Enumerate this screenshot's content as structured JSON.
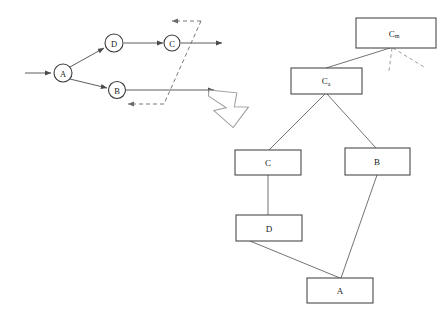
{
  "figure": {
    "left_graph": {
      "name": "execution-graph",
      "nodes": [
        {
          "id": "A",
          "label": "A",
          "cx": 63,
          "cy": 73,
          "r": 9
        },
        {
          "id": "D",
          "label": "D",
          "cx": 114,
          "cy": 43,
          "r": 9
        },
        {
          "id": "C",
          "label": "C",
          "cx": 172,
          "cy": 43,
          "r": 8
        },
        {
          "id": "B",
          "label": "B",
          "cx": 117,
          "cy": 90,
          "r": 8.5
        }
      ],
      "edges": [
        {
          "from": "input",
          "to": "A",
          "style": "solid",
          "arrow": true
        },
        {
          "from": "A",
          "to": "D",
          "style": "solid",
          "arrow": true
        },
        {
          "from": "A",
          "to": "B",
          "style": "solid",
          "arrow": true
        },
        {
          "from": "D",
          "to": "C",
          "style": "solid",
          "arrow": true
        },
        {
          "from": "C",
          "to": "output-top",
          "style": "solid",
          "arrow": true
        },
        {
          "from": "B",
          "to": "output-bottom",
          "style": "solid",
          "arrow": true
        },
        {
          "from": "feedback-right",
          "to": "feedback-top",
          "style": "dashed",
          "arrow": true
        },
        {
          "from": "feedback-right",
          "to": "feedback-bottom",
          "style": "dashed",
          "arrow": true
        }
      ]
    },
    "transform_arrow": {
      "name": "transform-arrow",
      "direction": "down-right"
    },
    "right_tree": {
      "name": "dependency-tree",
      "boxes": [
        {
          "id": "Cm",
          "label": "C",
          "sub": "m",
          "x": 356,
          "y": 18,
          "w": 80,
          "h": 30
        },
        {
          "id": "Ca",
          "label": "C",
          "sub": "a",
          "x": 291,
          "y": 68,
          "w": 71,
          "h": 26
        },
        {
          "id": "C",
          "label": "C",
          "sub": "",
          "x": 235,
          "y": 150,
          "w": 66,
          "h": 25
        },
        {
          "id": "B",
          "label": "B",
          "sub": "",
          "x": 345,
          "y": 148,
          "w": 65,
          "h": 27
        },
        {
          "id": "D",
          "label": "D",
          "sub": "",
          "x": 236,
          "y": 215,
          "w": 66,
          "h": 26
        },
        {
          "id": "A",
          "label": "A",
          "sub": "",
          "x": 307,
          "y": 278,
          "w": 66,
          "h": 25
        }
      ],
      "links": [
        {
          "from": "Cm",
          "to": "Ca",
          "style": "solid"
        },
        {
          "from": "Cm",
          "to": "unknown-1",
          "style": "dashed"
        },
        {
          "from": "Cm",
          "to": "unknown-2",
          "style": "dashed"
        },
        {
          "from": "Ca",
          "to": "C",
          "style": "solid"
        },
        {
          "from": "Ca",
          "to": "B",
          "style": "solid"
        },
        {
          "from": "C",
          "to": "D",
          "style": "solid"
        },
        {
          "from": "D",
          "to": "A",
          "style": "solid"
        },
        {
          "from": "B",
          "to": "A",
          "style": "solid"
        }
      ]
    }
  }
}
